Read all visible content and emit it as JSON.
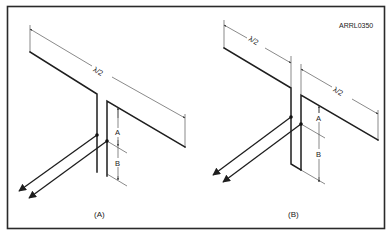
{
  "figure": {
    "id_label": "ARRL0350",
    "panels": [
      {
        "caption": "(A)",
        "dimension_labels": {
          "element_length": "λ/2",
          "segment_a": "A",
          "segment_b": "B"
        }
      },
      {
        "caption": "(B)",
        "dimension_labels": {
          "element_length_left": "λ/2",
          "element_length_right": "λ/2",
          "segment_a": "A",
          "segment_b": "B"
        }
      }
    ],
    "colors": {
      "line": "#1e1e1e",
      "background": "#ffffff",
      "frame": "#2a2a2a"
    }
  }
}
